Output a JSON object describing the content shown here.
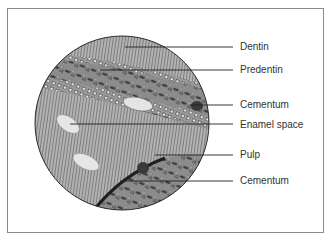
{
  "diagram": {
    "type": "histology-micrograph-illustration",
    "colors": {
      "frame_border": "#8a8a8a",
      "circle_outline": "#2a2a2a",
      "dentin_fill": "#a9a9a9",
      "band_fill": "#8f8f8f",
      "enamel_space_fill": "#e6e6e6",
      "leader_line": "#222222",
      "label_text": "#333333"
    },
    "labels": [
      {
        "id": "dentin",
        "text": "Dentin",
        "y": 47
      },
      {
        "id": "predentin",
        "text": "Predentin",
        "y": 70
      },
      {
        "id": "cementum-upper",
        "text": "Cementum",
        "y": 105
      },
      {
        "id": "enamel-space",
        "text": "Enamel space",
        "y": 125
      },
      {
        "id": "pulp",
        "text": "Pulp",
        "y": 155
      },
      {
        "id": "cementum-lower",
        "text": "Cementum",
        "y": 181
      }
    ]
  }
}
